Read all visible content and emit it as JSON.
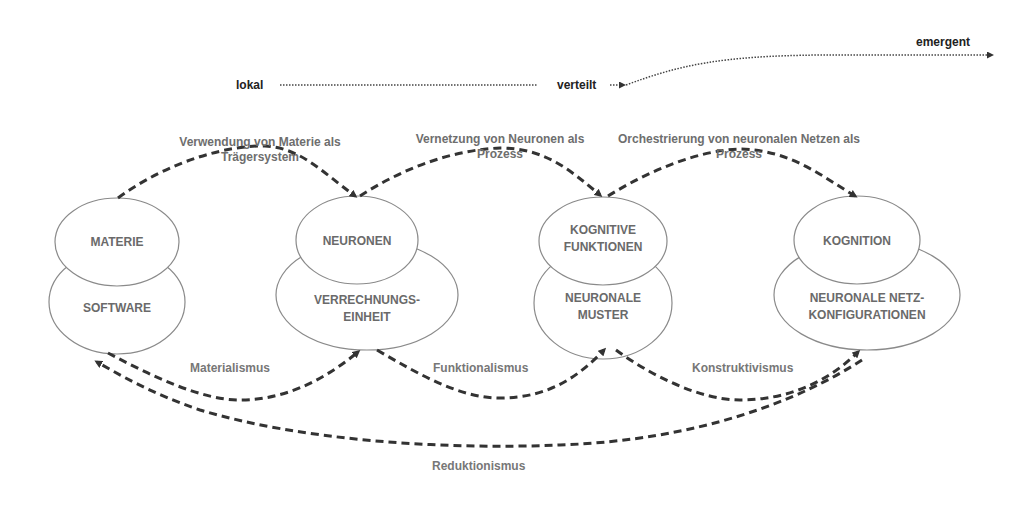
{
  "axis": {
    "start": "lokal",
    "middle": "verteilt",
    "end": "emergent"
  },
  "process_labels": [
    {
      "line1": "Verwendung von Materie als",
      "line2": "Trägersystem"
    },
    {
      "line1": "Vernetzung von Neuronen als",
      "line2": "Prozess"
    },
    {
      "line1": "Orchestrierung von neuronalen Netzen als",
      "line2": "Prozess"
    }
  ],
  "nodes": [
    {
      "top": "MATERIE",
      "bottom_line1": "SOFTWARE",
      "bottom_line2": ""
    },
    {
      "top": "NEURONEN",
      "bottom_line1": "VERRECHNUNGS-",
      "bottom_line2": "EINHEIT"
    },
    {
      "top_line1": "KOGNITIVE",
      "top_line2": "FUNKTIONEN",
      "bottom_line1": "NEURONALE",
      "bottom_line2": "MUSTER"
    },
    {
      "top": "KOGNITION",
      "bottom_line1": "NEURONALE NETZ-",
      "bottom_line2": "KONFIGURATIONEN"
    }
  ],
  "positions": [
    "Materialismus",
    "Funktionalismus",
    "Konstruktivismus",
    "Reduktionismus"
  ],
  "colors": {
    "arrow": "#333333",
    "ellipse_stroke": "#8a8a8a",
    "text_gray": "#6a6a6a"
  }
}
